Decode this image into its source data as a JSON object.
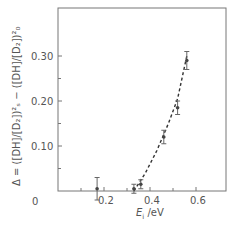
{
  "chart_data": {
    "type": "scatter",
    "title": "",
    "xlabel": "E_i /eV",
    "ylabel": "Δ = ([DH]/[D₂])²_s − ([DH]/[D₂])²_0",
    "xlim": [
      0,
      0.73
    ],
    "ylim": [
      0,
      0.4
    ],
    "x_ticks": [
      0.2,
      0.4,
      0.6
    ],
    "x_tick_labels": [
      "0.2",
      "0.4",
      "0.6"
    ],
    "x_minor_ticks": [
      0.1,
      0.3,
      0.5
    ],
    "y_ticks": [
      0.1,
      0.2,
      0.3
    ],
    "y_tick_labels": [
      "0.10",
      "0.20",
      "0.30"
    ],
    "y_minor_ticks": [
      0.05,
      0.15,
      0.25
    ],
    "origin_label": "0",
    "grid": false,
    "legend": null,
    "points": [
      {
        "x": 0.17,
        "y": 0.005,
        "err_low": 0.025,
        "err_high": 0.025
      },
      {
        "x": 0.33,
        "y": 0.005,
        "err_low": 0.01,
        "err_high": 0.01
      },
      {
        "x": 0.36,
        "y": 0.015,
        "err_low": 0.01,
        "err_high": 0.01
      },
      {
        "x": 0.46,
        "y": 0.12,
        "err_low": 0.015,
        "err_high": 0.015
      },
      {
        "x": 0.52,
        "y": 0.185,
        "err_low": 0.015,
        "err_high": 0.015
      },
      {
        "x": 0.56,
        "y": 0.29,
        "err_low": 0.02,
        "err_high": 0.02
      }
    ],
    "fit_curve": {
      "style": "dashed",
      "x": [
        0.33,
        0.38,
        0.43,
        0.48,
        0.52,
        0.56
      ],
      "y": [
        0.0,
        0.04,
        0.09,
        0.15,
        0.205,
        0.3
      ]
    }
  },
  "labels": {
    "origin": "0",
    "x_axis_title_main": "E",
    "x_axis_title_sub": "i",
    "x_axis_title_unit": " /eV",
    "y_axis_title": "Δ = ([DH]/[D₂])²ₛ − ([DH]/[D₂])²₀"
  }
}
